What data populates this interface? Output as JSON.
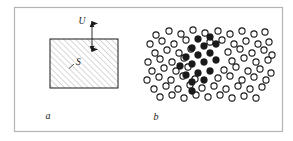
{
  "figure": {
    "background_color": "#ffffff",
    "border_color": "#b3b3b3",
    "ink_color": "#1a1a1a",
    "hatch_color": "#a8a8a8",
    "frame": {
      "x": 14,
      "y": 7,
      "width": 269,
      "height": 125
    },
    "panels": [
      {
        "id": "panel-a",
        "caption": "a",
        "caption_pos": {
          "x": 48,
          "y": 119
        },
        "type": "hatched-rectangle-with-arrow",
        "rect": {
          "x": 50,
          "y": 39,
          "width": 68,
          "height": 49
        },
        "hatch": {
          "angle_deg": 45,
          "spacing": 4.2,
          "line_width": 0.9
        },
        "area_label": {
          "text": "S",
          "x": 76,
          "y": 63,
          "leader": {
            "x1": 69,
            "y1": 68,
            "x2": 74,
            "y2": 64
          }
        },
        "arrow": {
          "label": "U",
          "label_x": 82,
          "label_y": 22,
          "x": 92,
          "y_top": 21,
          "y_bottom": 52,
          "double_headed": true
        }
      },
      {
        "id": "panel-b",
        "caption": "b",
        "caption_pos": {
          "x": 156,
          "y": 120
        },
        "type": "circle-lattice-with-cluster",
        "circle_radius": 3.1,
        "open_circle_stroke": 1.1,
        "open_circles": [
          [
            156,
            35
          ],
          [
            169,
            31
          ],
          [
            181,
            34
          ],
          [
            193,
            30
          ],
          [
            205,
            33
          ],
          [
            218,
            31
          ],
          [
            230,
            34
          ],
          [
            242,
            31
          ],
          [
            254,
            34
          ],
          [
            265,
            32
          ],
          [
            150,
            44
          ],
          [
            162,
            41
          ],
          [
            174,
            44
          ],
          [
            186,
            40
          ],
          [
            210,
            42
          ],
          [
            222,
            40
          ],
          [
            234,
            44
          ],
          [
            246,
            41
          ],
          [
            258,
            44
          ],
          [
            269,
            42
          ],
          [
            155,
            53
          ],
          [
            167,
            50
          ],
          [
            179,
            53
          ],
          [
            191,
            49
          ],
          [
            228,
            52
          ],
          [
            240,
            49
          ],
          [
            252,
            53
          ],
          [
            264,
            50
          ],
          [
            272,
            55
          ],
          [
            148,
            62
          ],
          [
            160,
            59
          ],
          [
            172,
            62
          ],
          [
            184,
            58
          ],
          [
            232,
            61
          ],
          [
            244,
            58
          ],
          [
            256,
            62
          ],
          [
            268,
            60
          ],
          [
            152,
            71
          ],
          [
            164,
            68
          ],
          [
            176,
            71
          ],
          [
            188,
            67
          ],
          [
            224,
            70
          ],
          [
            236,
            67
          ],
          [
            248,
            71
          ],
          [
            260,
            69
          ],
          [
            271,
            73
          ],
          [
            147,
            80
          ],
          [
            159,
            77
          ],
          [
            171,
            80
          ],
          [
            183,
            76
          ],
          [
            195,
            79
          ],
          [
            218,
            78
          ],
          [
            230,
            76
          ],
          [
            242,
            80
          ],
          [
            254,
            77
          ],
          [
            266,
            80
          ],
          [
            154,
            89
          ],
          [
            166,
            86
          ],
          [
            178,
            89
          ],
          [
            190,
            85
          ],
          [
            202,
            88
          ],
          [
            214,
            86
          ],
          [
            226,
            89
          ],
          [
            238,
            86
          ],
          [
            250,
            89
          ],
          [
            262,
            87
          ],
          [
            160,
            97
          ],
          [
            172,
            95
          ],
          [
            184,
            98
          ],
          [
            196,
            95
          ],
          [
            208,
            97
          ],
          [
            220,
            95
          ],
          [
            232,
            98
          ],
          [
            244,
            96
          ],
          [
            256,
            98
          ]
        ],
        "filled_circles": [
          [
            198,
            39
          ],
          [
            210,
            37
          ],
          [
            192,
            48
          ],
          [
            204,
            46
          ],
          [
            216,
            44
          ],
          [
            186,
            57
          ],
          [
            198,
            55
          ],
          [
            210,
            53
          ],
          [
            180,
            66
          ],
          [
            192,
            64
          ],
          [
            204,
            62
          ],
          [
            216,
            60
          ],
          [
            186,
            75
          ],
          [
            198,
            73
          ],
          [
            210,
            71
          ],
          [
            192,
            82
          ],
          [
            204,
            80
          ],
          [
            192,
            91
          ]
        ]
      }
    ]
  }
}
